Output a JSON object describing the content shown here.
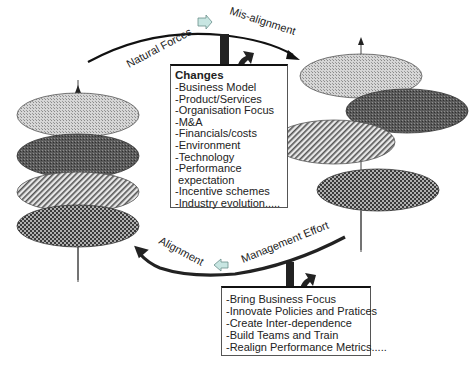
{
  "top_curve": {
    "left_label": "Natural Forces",
    "right_label": "Mis-alignment"
  },
  "bottom_curve": {
    "left_label": "Alignment",
    "right_label": "Management Effort"
  },
  "changes_box": {
    "title": "Changes",
    "items": [
      "-Business Model",
      "-Product/Services",
      "-Organisation Focus",
      "-M&A",
      "-Financials/costs",
      "-Environment",
      "-Technology",
      "-Performance",
      " expectation",
      "-Incentive schemes",
      "-Industry evolution....."
    ]
  },
  "effort_box": {
    "items": [
      "-Bring Business Focus",
      "-Innovate Policies and Pratices",
      "-Create Inter-dependence",
      "-Build Teams and Train",
      "-Realign Performance Metrics....."
    ]
  },
  "stacks": {
    "left": {
      "state": "aligned",
      "discs": [
        "light-dotted",
        "dark-dotted",
        "hatched",
        "checkered"
      ]
    },
    "right": {
      "state": "misaligned",
      "discs": [
        "light-dotted",
        "dark-dotted",
        "hatched",
        "checkered"
      ]
    }
  },
  "colors": {
    "direction_arrow_fill": "#c8e6e2",
    "direction_arrow_stroke": "#6a8f8b",
    "curve": "#1a1a1a"
  }
}
